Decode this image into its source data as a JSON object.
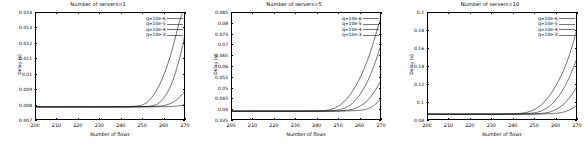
{
  "figure": {
    "panel_count": 3,
    "background": "#ffffff",
    "line_color": "#000000"
  },
  "chart_data": [
    {
      "type": "line",
      "title": "Number of servers=1",
      "xlabel": "Number of flows",
      "ylabel": "Delay (s)",
      "xlim": [
        200,
        270
      ],
      "ylim": [
        0.007,
        0.014
      ],
      "xticks": [
        200,
        210,
        220,
        230,
        240,
        250,
        260,
        270
      ],
      "xticklabels": [
        "200",
        "210",
        "220",
        "230",
        "240",
        "250",
        "260",
        "270"
      ],
      "yticks": [
        0.007,
        0.008,
        0.009,
        0.01,
        0.011,
        0.012,
        0.013,
        0.014
      ],
      "yticklabels": [
        "0.007",
        "0.008",
        "0.009",
        "0.01",
        "0.011",
        "0.012",
        "0.013",
        "0.014"
      ],
      "grid": false,
      "legend_position": "upper right",
      "baseline": 0.00785,
      "series": [
        {
          "name": "q=10e-6",
          "knee": 249,
          "x": [
            200,
            210,
            220,
            230,
            240,
            245,
            249,
            252,
            255,
            258,
            261,
            264,
            267,
            269,
            270
          ],
          "y": [
            0.00785,
            0.00785,
            0.00785,
            0.00785,
            0.00786,
            0.00788,
            0.00793,
            0.00812,
            0.00855,
            0.00925,
            0.01025,
            0.01155,
            0.01315,
            0.014,
            0.014
          ]
        },
        {
          "name": "q=10e-5",
          "knee": 255,
          "x": [
            200,
            210,
            220,
            230,
            240,
            250,
            255,
            258,
            261,
            264,
            267,
            269,
            270
          ],
          "y": [
            0.00785,
            0.00785,
            0.00785,
            0.00785,
            0.00785,
            0.00787,
            0.00793,
            0.00812,
            0.0086,
            0.00945,
            0.01075,
            0.0119,
            0.01255
          ]
        },
        {
          "name": "q=10e-4",
          "knee": 261,
          "x": [
            200,
            210,
            220,
            230,
            240,
            250,
            258,
            261,
            264,
            266,
            268,
            270
          ],
          "y": [
            0.00785,
            0.00785,
            0.00785,
            0.00785,
            0.00785,
            0.00786,
            0.0079,
            0.00796,
            0.00812,
            0.0083,
            0.00855,
            0.00885
          ]
        },
        {
          "name": "q=10e-3",
          "knee": 266,
          "x": [
            200,
            210,
            220,
            230,
            240,
            250,
            260,
            265,
            268,
            270
          ],
          "y": [
            0.00785,
            0.00785,
            0.00785,
            0.00785,
            0.00785,
            0.00785,
            0.00786,
            0.00789,
            0.00794,
            0.008
          ]
        }
      ]
    },
    {
      "type": "line",
      "title": "Number of servers=5",
      "xlabel": "Number of flows",
      "ylabel": "Delay (s)",
      "xlim": [
        200,
        270
      ],
      "ylim": [
        0.035,
        0.085
      ],
      "xticks": [
        200,
        210,
        220,
        230,
        240,
        250,
        260,
        270
      ],
      "xticklabels": [
        "200",
        "210",
        "220",
        "230",
        "240",
        "250",
        "260",
        "270"
      ],
      "yticks": [
        0.035,
        0.04,
        0.045,
        0.05,
        0.055,
        0.06,
        0.065,
        0.07,
        0.075,
        0.08,
        0.085
      ],
      "yticklabels": [
        "0.035",
        "0.04",
        "0.045",
        "0.05",
        "0.055",
        "0.06",
        "0.065",
        "0.07",
        "0.075",
        "0.08",
        "0.085"
      ],
      "grid": false,
      "legend_position": "upper right",
      "baseline": 0.0391,
      "series": [
        {
          "name": "q=10e-6",
          "knee": 246,
          "x": [
            200,
            210,
            220,
            230,
            240,
            244,
            247,
            250,
            253,
            256,
            259,
            262,
            265,
            268,
            270
          ],
          "y": [
            0.0391,
            0.0391,
            0.0391,
            0.0391,
            0.0392,
            0.0394,
            0.04,
            0.0413,
            0.0437,
            0.0473,
            0.0522,
            0.0585,
            0.0663,
            0.076,
            0.0825
          ]
        },
        {
          "name": "q=10e-5",
          "knee": 252,
          "x": [
            200,
            210,
            220,
            230,
            240,
            248,
            252,
            255,
            258,
            261,
            264,
            267,
            270
          ],
          "y": [
            0.0391,
            0.0391,
            0.0391,
            0.0391,
            0.0391,
            0.0394,
            0.0401,
            0.0415,
            0.0441,
            0.048,
            0.0535,
            0.0608,
            0.07
          ]
        },
        {
          "name": "q=10e-4",
          "knee": 258,
          "x": [
            200,
            210,
            220,
            230,
            240,
            250,
            256,
            259,
            262,
            265,
            268,
            270
          ],
          "y": [
            0.0391,
            0.0391,
            0.0391,
            0.0391,
            0.0391,
            0.0392,
            0.0398,
            0.0408,
            0.0426,
            0.0455,
            0.0498,
            0.0535
          ]
        },
        {
          "name": "q=10e-3",
          "knee": 264,
          "x": [
            200,
            210,
            220,
            230,
            240,
            250,
            260,
            264,
            267,
            269,
            270
          ],
          "y": [
            0.0391,
            0.0391,
            0.0391,
            0.0391,
            0.0391,
            0.0391,
            0.0395,
            0.0403,
            0.042,
            0.0438,
            0.045
          ]
        }
      ]
    },
    {
      "type": "line",
      "title": "Number of servers=10",
      "xlabel": "Number of flows",
      "ylabel": "Delay (s)",
      "xlim": [
        200,
        270
      ],
      "ylim": [
        0.08,
        0.2
      ],
      "xticks": [
        200,
        210,
        220,
        230,
        240,
        250,
        260,
        270
      ],
      "xticklabels": [
        "200",
        "210",
        "220",
        "230",
        "240",
        "250",
        "260",
        "270"
      ],
      "yticks": [
        0.08,
        0.1,
        0.12,
        0.14,
        0.16,
        0.18,
        0.2
      ],
      "yticklabels": [
        "0.08",
        "0.1",
        "0.12",
        "0.14",
        "0.16",
        "0.18",
        "0.2"
      ],
      "grid": false,
      "legend_position": "upper right",
      "baseline": 0.0865,
      "series": [
        {
          "name": "q=10e-6",
          "knee": 245,
          "x": [
            200,
            210,
            220,
            230,
            240,
            244,
            247,
            250,
            253,
            256,
            259,
            262,
            265,
            268,
            270
          ],
          "y": [
            0.0865,
            0.0865,
            0.0865,
            0.0866,
            0.0869,
            0.0875,
            0.0888,
            0.0915,
            0.0962,
            0.1035,
            0.1135,
            0.1265,
            0.1425,
            0.164,
            0.181
          ]
        },
        {
          "name": "q=10e-5",
          "knee": 251,
          "x": [
            200,
            210,
            220,
            230,
            240,
            248,
            252,
            255,
            258,
            261,
            264,
            267,
            270
          ],
          "y": [
            0.0865,
            0.0865,
            0.0865,
            0.0865,
            0.0866,
            0.0874,
            0.089,
            0.092,
            0.0972,
            0.105,
            0.116,
            0.1305,
            0.149
          ]
        },
        {
          "name": "q=10e-4",
          "knee": 257,
          "x": [
            200,
            210,
            220,
            230,
            240,
            250,
            256,
            259,
            262,
            265,
            268,
            270
          ],
          "y": [
            0.0865,
            0.0865,
            0.0865,
            0.0865,
            0.0865,
            0.0868,
            0.0882,
            0.0903,
            0.0942,
            0.1005,
            0.1095,
            0.1175
          ]
        },
        {
          "name": "q=10e-3",
          "knee": 263,
          "x": [
            200,
            210,
            220,
            230,
            240,
            250,
            260,
            264,
            267,
            269,
            270
          ],
          "y": [
            0.0865,
            0.0865,
            0.0865,
            0.0865,
            0.0865,
            0.0865,
            0.0874,
            0.089,
            0.092,
            0.0948,
            0.0965
          ]
        }
      ]
    }
  ]
}
